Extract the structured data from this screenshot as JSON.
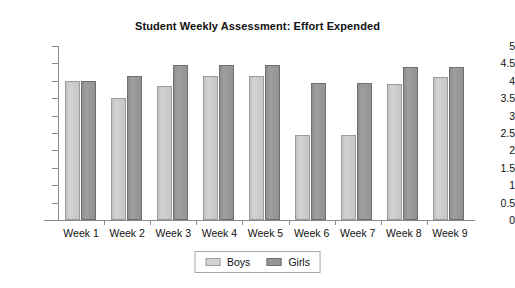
{
  "chart_data": {
    "type": "bar",
    "title": "Student Weekly Assessment: Effort Expended",
    "xlabel": "",
    "ylabel": "",
    "ylim": [
      0,
      5
    ],
    "ytick_step": 0.5,
    "yticks": [
      "5",
      "4.5",
      "4",
      "3.5",
      "3",
      "2.5",
      "2",
      "1.5",
      "1",
      "0.5",
      "0"
    ],
    "grid": false,
    "legend_position": "bottom-center",
    "categories": [
      "Week 1",
      "Week 2",
      "Week 3",
      "Week 4",
      "Week 5",
      "Week 6",
      "Week 7",
      "Week 8",
      "Week 9"
    ],
    "series": [
      {
        "name": "Boys",
        "color": "#d2d2d2",
        "values": [
          4.0,
          3.5,
          3.85,
          4.15,
          4.15,
          2.45,
          2.45,
          3.9,
          4.1
        ]
      },
      {
        "name": "Girls",
        "color": "#969696",
        "values": [
          4.0,
          4.15,
          4.45,
          4.45,
          4.45,
          3.95,
          3.95,
          4.4,
          4.4
        ]
      }
    ]
  }
}
